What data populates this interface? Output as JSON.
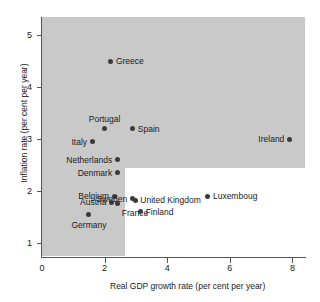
{
  "chart_data": {
    "type": "scatter",
    "title": "",
    "xlabel": "Real GDP growth rate (per cent per year)",
    "ylabel": "Inflation rate (per cent per year)",
    "xlim": [
      0,
      8.4
    ],
    "ylim": [
      0.75,
      5.35
    ],
    "xticks": [
      "0",
      "2",
      "4",
      "6",
      "8"
    ],
    "xtick_values": [
      0,
      2,
      4,
      6,
      8
    ],
    "yticks": [
      "1",
      "2",
      "3",
      "4",
      "5"
    ],
    "ytick_values": [
      1,
      2,
      3,
      4,
      5
    ],
    "grid": false,
    "legend": null,
    "shaded_region": {
      "description": "grey band covering high-inflation and low-growth area",
      "color": "#c9c9c9",
      "notch_x_min": 2.65,
      "notch_y_max": 2.45
    },
    "points": [
      {
        "label": "Greece",
        "x": 2.2,
        "y": 4.5,
        "label_pos": "right"
      },
      {
        "label": "Portugal",
        "x": 2.0,
        "y": 3.2,
        "label_pos": "above"
      },
      {
        "label": "Spain",
        "x": 2.9,
        "y": 3.2,
        "label_pos": "right"
      },
      {
        "label": "Ireland",
        "x": 7.9,
        "y": 3.0,
        "label_pos": "left"
      },
      {
        "label": "Italy",
        "x": 1.6,
        "y": 2.95,
        "label_pos": "left"
      },
      {
        "label": "Netherlands",
        "x": 2.4,
        "y": 2.6,
        "label_pos": "left"
      },
      {
        "label": "Denmark",
        "x": 2.4,
        "y": 2.35,
        "label_pos": "left"
      },
      {
        "label": "Belgium",
        "x": 2.3,
        "y": 1.9,
        "label_pos": "left"
      },
      {
        "label": "Austria",
        "x": 2.22,
        "y": 1.78,
        "label_pos": "left"
      },
      {
        "label": "France",
        "x": 2.42,
        "y": 1.76,
        "label_pos": "below-right"
      },
      {
        "label": "Germany",
        "x": 1.5,
        "y": 1.55,
        "label_pos": "below"
      },
      {
        "label": "Sweden",
        "x": 2.88,
        "y": 1.85,
        "label_pos": "left"
      },
      {
        "label": "United Kingdom",
        "x": 2.98,
        "y": 1.82,
        "label_pos": "right"
      },
      {
        "label": "Luxemboug",
        "x": 5.3,
        "y": 1.9,
        "label_pos": "right"
      },
      {
        "label": "Finland",
        "x": 3.15,
        "y": 1.6,
        "label_pos": "right"
      }
    ]
  },
  "colors": {
    "shade": "#c9c9c9",
    "marker": "#3b3b3b",
    "axis": "#555555",
    "text": "#1a1a1a",
    "background": "#ffffff"
  }
}
